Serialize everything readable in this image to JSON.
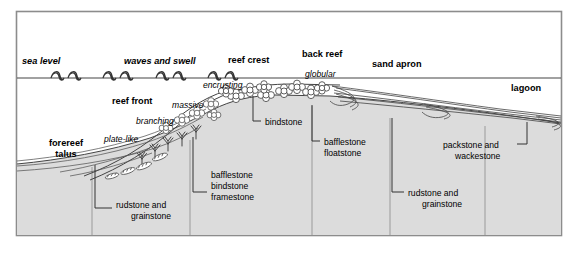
{
  "figure": {
    "type": "geological-cross-section-diagram",
    "frame": {
      "border_color": "#8c8c8c",
      "background": "#ffffff"
    },
    "colors": {
      "substrate_fill": "#dcdcdc",
      "water_fill": "#ffffff",
      "line": "#333333",
      "frame": "#8c8c8c",
      "text": "#000000"
    }
  },
  "zone_labels": [
    {
      "id": "sea-level",
      "text": "sea level",
      "style": "bold-italic",
      "x": 22,
      "y": 64
    },
    {
      "id": "waves-and-swell",
      "text": "waves and swell",
      "style": "bold-italic",
      "x": 124,
      "y": 64
    },
    {
      "id": "reef-crest",
      "text": "reef crest",
      "style": "bold",
      "x": 228,
      "y": 63
    },
    {
      "id": "back-reef",
      "text": "back reef",
      "style": "bold",
      "x": 302,
      "y": 57
    },
    {
      "id": "sand-apron",
      "text": "sand apron",
      "style": "bold",
      "x": 372,
      "y": 67
    },
    {
      "id": "lagoon",
      "text": "lagoon",
      "style": "bold",
      "x": 511,
      "y": 91
    },
    {
      "id": "reef-front",
      "text": "reef front",
      "style": "bold",
      "x": 112,
      "y": 104
    },
    {
      "id": "forereef",
      "text": "forereef",
      "style": "bold",
      "x": 66,
      "y": 146
    },
    {
      "id": "talus",
      "text": "talus",
      "style": "bold",
      "x": 66,
      "y": 157
    }
  ],
  "growth_form_labels": [
    {
      "id": "encrusting",
      "text": "encrusting",
      "style": "italic",
      "x": 203,
      "y": 88
    },
    {
      "id": "globular",
      "text": "globular",
      "style": "italic",
      "x": 305,
      "y": 77
    },
    {
      "id": "massive",
      "text": "massive",
      "style": "italic",
      "x": 172,
      "y": 108
    },
    {
      "id": "branching",
      "text": "branching",
      "style": "italic",
      "x": 136,
      "y": 124
    },
    {
      "id": "plate-like",
      "text": "plate-like",
      "style": "italic",
      "x": 104,
      "y": 142
    }
  ],
  "facies_labels": [
    {
      "id": "rudstone-and-grainstone-forereef",
      "lines": [
        "rudstone and",
        "grainstone"
      ],
      "text_x": 116,
      "text_y": 208,
      "leader": {
        "from_x": 95,
        "from_y": 165,
        "elbow_x": 95,
        "elbow_y": 208,
        "to_x": 112,
        "to_y": 208
      }
    },
    {
      "id": "bafflestone-bindstone-framestone",
      "lines": [
        "bafflestone",
        "bindstone",
        "framestone"
      ],
      "text_x": 211,
      "text_y": 178,
      "leader": {
        "from_x": 193,
        "from_y": 137,
        "elbow_x": 193,
        "elbow_y": 192,
        "to_x": 207,
        "to_y": 192
      }
    },
    {
      "id": "bindstone",
      "lines": [
        "bindstone"
      ],
      "text_x": 265,
      "text_y": 125,
      "leader": {
        "from_x": 253,
        "from_y": 96,
        "elbow_x": 253,
        "elbow_y": 121,
        "to_x": 261,
        "to_y": 121
      }
    },
    {
      "id": "bafflestone-floatstone",
      "lines": [
        "bafflestone",
        "floatstone"
      ],
      "text_x": 324,
      "text_y": 145,
      "leader": {
        "from_x": 312,
        "from_y": 105,
        "elbow_x": 312,
        "elbow_y": 141,
        "to_x": 320,
        "to_y": 141
      }
    },
    {
      "id": "rudstone-and-grainstone-apron",
      "lines": [
        "rudstone and",
        "grainstone"
      ],
      "text_x": 408,
      "text_y": 196,
      "leader": {
        "from_x": 392,
        "from_y": 118,
        "elbow_x": 392,
        "elbow_y": 192,
        "to_x": 404,
        "to_y": 192
      }
    },
    {
      "id": "packstone-and-wackestone",
      "lines": [
        "packstone and",
        "wackestone"
      ],
      "text_x": 492,
      "text_y": 148,
      "leader": {
        "from_x": 527,
        "from_y": 122,
        "elbow_x": 527,
        "elbow_y": 144,
        "to_x": 517,
        "to_y": 144
      }
    }
  ],
  "coral_symbols": {
    "globular_reef_crest_count": 9,
    "massive_slope_count": 5,
    "branching_slope_count": 5,
    "platelike_slope_count": 4
  },
  "wave_symbols": {
    "count": 8,
    "baseline_y": 78
  }
}
